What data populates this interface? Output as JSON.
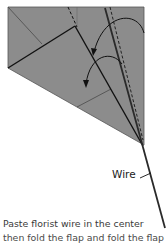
{
  "diagram": {
    "paper_color": "#8c8c8c",
    "line_color": "#1a1a1a",
    "labels": {
      "wire": "Wire"
    }
  },
  "caption": {
    "line1": "Paste florist wire in the center",
    "line2": "then fold the flap and fold the flap"
  }
}
